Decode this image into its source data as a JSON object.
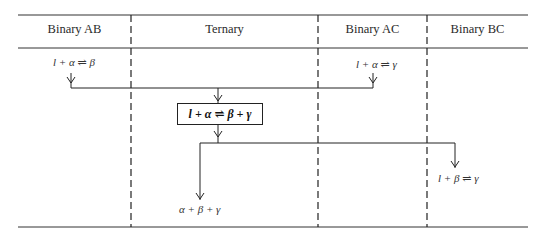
{
  "diagram": {
    "columns": [
      {
        "id": "binary-ab",
        "label": "Binary AB"
      },
      {
        "id": "ternary",
        "label": "Ternary"
      },
      {
        "id": "binary-ac",
        "label": "Binary AC"
      },
      {
        "id": "binary-bc",
        "label": "Binary BC"
      }
    ],
    "reactions": {
      "ab_peritectic": "l + α ⇌ β",
      "ac_peritectic": "l + α ⇌ γ",
      "ternary_class": "l + α ⇌ β + γ",
      "ternary_product": "α + β + γ",
      "bc_peritectic": "l + β ⇌ γ"
    },
    "colors": {
      "line": "#222222",
      "background": "#ffffff"
    }
  }
}
